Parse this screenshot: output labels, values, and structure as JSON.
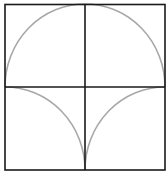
{
  "diagram": {
    "colors": {
      "frame": "#1a1a1a",
      "arc": "#a8a8a8",
      "background": "#ffffff"
    },
    "square": {
      "x": 4,
      "y": 4,
      "w": 161,
      "h": 166
    },
    "center": {
      "x": 85,
      "y": 87
    }
  }
}
